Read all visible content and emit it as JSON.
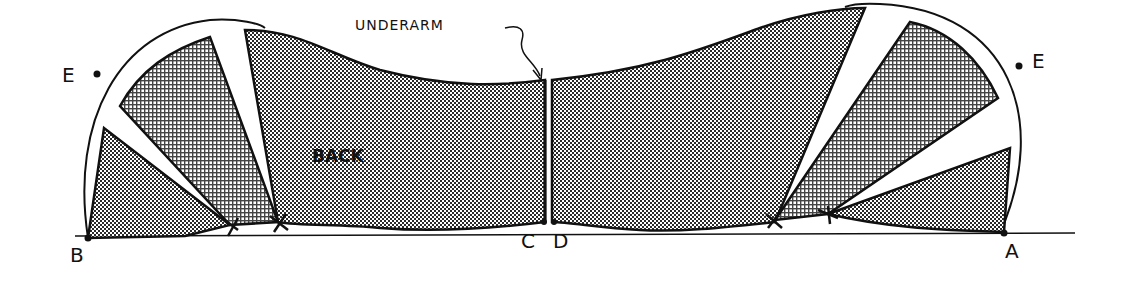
{
  "diagram": {
    "labels": {
      "underarm": "UNDERARM",
      "back": "BACK",
      "point_b": "B",
      "point_c": "C",
      "point_d": "D",
      "point_a": "A",
      "point_e_left": "E",
      "point_e_right": "E"
    },
    "colors": {
      "ink": "#111111",
      "paper": "#ffffff",
      "dot_fill": "#2a2a2a",
      "grid_fill": "#444444"
    }
  }
}
